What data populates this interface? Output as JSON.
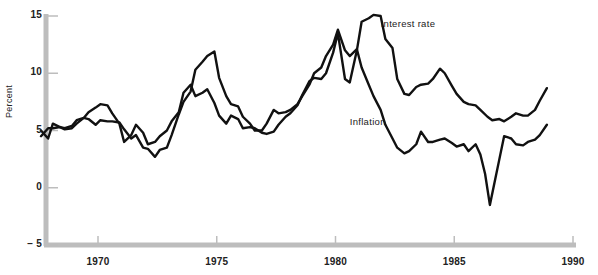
{
  "chart_data": {
    "type": "line",
    "title": "",
    "subtitle": "",
    "xlabel": "",
    "ylabel": "Percent",
    "xlim": [
      1967.5,
      1989.5
    ],
    "ylim": [
      -5,
      15.8
    ],
    "xticks": [
      1970,
      1975,
      1980,
      1985,
      1990
    ],
    "xtick_labels": [
      "1970",
      "1975",
      "1980",
      "1985",
      "1990"
    ],
    "yticks": [
      -5,
      0,
      5,
      10,
      15
    ],
    "ytick_labels": [
      "− 5",
      "0",
      "5",
      "10",
      "15"
    ],
    "grid": false,
    "legend_position": "inline-annotation",
    "annotations": [
      {
        "text": "Interest rate",
        "x": 1981.9,
        "y": 14.3
      },
      {
        "text": "Inflation",
        "x": 1980.6,
        "y": 5.7
      }
    ],
    "line_color": "#111111",
    "axis_color": "#b9b9b9",
    "series": [
      {
        "name": "Interest rate",
        "color": "#111111",
        "x": [
          1967.6,
          1967.9,
          1968.1,
          1968.4,
          1968.6,
          1968.9,
          1969.1,
          1969.4,
          1969.6,
          1969.9,
          1970.1,
          1970.4,
          1970.6,
          1970.9,
          1971.1,
          1971.4,
          1971.6,
          1971.9,
          1972.1,
          1972.4,
          1972.6,
          1972.9,
          1973.1,
          1973.4,
          1973.6,
          1973.9,
          1974.1,
          1974.4,
          1974.6,
          1974.9,
          1975.1,
          1975.4,
          1975.6,
          1975.9,
          1976.1,
          1976.4,
          1976.6,
          1976.9,
          1977.1,
          1977.4,
          1977.6,
          1977.9,
          1978.1,
          1978.4,
          1978.6,
          1978.9,
          1979.1,
          1979.4,
          1979.6,
          1979.9,
          1980.1,
          1980.4,
          1980.6,
          1980.9,
          1981.1,
          1981.4,
          1981.6,
          1981.9,
          1982.1,
          1982.4,
          1982.6,
          1982.9,
          1983.1,
          1983.4,
          1983.6,
          1983.9,
          1984.1,
          1984.4,
          1984.6,
          1984.9,
          1985.1,
          1985.4,
          1985.6,
          1985.9,
          1986.1,
          1986.4,
          1986.6,
          1986.9,
          1987.1,
          1987.4,
          1987.6,
          1987.9,
          1988.1,
          1988.4,
          1988.6,
          1988.9
        ],
        "values": [
          5.0,
          4.3,
          5.6,
          5.3,
          5.2,
          5.4,
          5.9,
          6.1,
          6.6,
          7.0,
          7.3,
          7.2,
          6.5,
          5.6,
          4.0,
          4.6,
          5.5,
          4.8,
          3.8,
          4.0,
          4.5,
          5.0,
          5.8,
          6.6,
          8.3,
          9.0,
          8.0,
          8.3,
          8.6,
          7.4,
          6.3,
          5.6,
          6.3,
          6.0,
          5.2,
          5.3,
          5.2,
          4.8,
          4.7,
          4.9,
          5.5,
          6.2,
          6.5,
          7.2,
          8.1,
          9.3,
          9.6,
          9.5,
          10.0,
          11.8,
          13.5,
          9.5,
          9.2,
          12.0,
          14.5,
          14.8,
          15.1,
          15.0,
          13.0,
          12.2,
          9.5,
          8.2,
          8.1,
          8.8,
          9.0,
          9.1,
          9.5,
          10.4,
          10.0,
          8.9,
          8.2,
          7.5,
          7.3,
          7.2,
          6.8,
          6.2,
          5.9,
          6.0,
          5.8,
          6.2,
          6.5,
          6.3,
          6.3,
          6.8,
          7.6,
          8.7
        ]
      },
      {
        "name": "Inflation",
        "color": "#111111",
        "x": [
          1967.6,
          1967.9,
          1968.1,
          1968.4,
          1968.6,
          1968.9,
          1969.1,
          1969.4,
          1969.6,
          1969.9,
          1970.1,
          1970.4,
          1970.6,
          1970.9,
          1971.1,
          1971.4,
          1971.6,
          1971.9,
          1972.1,
          1972.4,
          1972.6,
          1972.9,
          1973.1,
          1973.4,
          1973.6,
          1973.9,
          1974.1,
          1974.4,
          1974.6,
          1974.9,
          1975.1,
          1975.4,
          1975.6,
          1975.9,
          1976.1,
          1976.4,
          1976.6,
          1976.9,
          1977.1,
          1977.4,
          1977.6,
          1977.9,
          1978.1,
          1978.4,
          1978.6,
          1978.9,
          1979.1,
          1979.4,
          1979.6,
          1979.9,
          1980.1,
          1980.4,
          1980.6,
          1980.9,
          1981.1,
          1981.4,
          1981.6,
          1981.9,
          1982.1,
          1982.4,
          1982.6,
          1982.9,
          1983.1,
          1983.4,
          1983.6,
          1983.9,
          1984.1,
          1984.4,
          1984.6,
          1984.9,
          1985.1,
          1985.4,
          1985.6,
          1985.9,
          1986.1,
          1986.3,
          1986.5,
          1986.7,
          1986.9,
          1987.1,
          1987.4,
          1987.6,
          1987.9,
          1988.1,
          1988.4,
          1988.6,
          1988.9
        ],
        "values": [
          4.5,
          5.2,
          5.2,
          5.3,
          5.1,
          5.2,
          5.6,
          6.1,
          6.0,
          5.5,
          5.9,
          5.8,
          5.8,
          5.7,
          5.1,
          4.3,
          4.6,
          3.5,
          3.4,
          2.7,
          3.3,
          3.5,
          4.6,
          6.4,
          7.5,
          8.4,
          10.3,
          11.0,
          11.5,
          11.9,
          9.6,
          8.0,
          7.3,
          7.1,
          6.2,
          5.6,
          5.0,
          5.0,
          5.6,
          6.8,
          6.5,
          6.6,
          6.8,
          7.3,
          8.0,
          9.0,
          10.0,
          10.5,
          11.5,
          12.5,
          13.8,
          12.0,
          11.5,
          12.1,
          10.5,
          9.0,
          8.0,
          6.8,
          5.5,
          4.3,
          3.5,
          3.0,
          3.2,
          3.8,
          4.9,
          4.0,
          4.0,
          4.2,
          4.3,
          3.9,
          3.6,
          3.8,
          3.2,
          3.8,
          2.9,
          1.2,
          -1.5,
          0.5,
          2.5,
          4.5,
          4.3,
          3.8,
          3.7,
          4.0,
          4.2,
          4.6,
          5.5
        ]
      }
    ]
  },
  "axis": {
    "y_title": "Percent"
  }
}
